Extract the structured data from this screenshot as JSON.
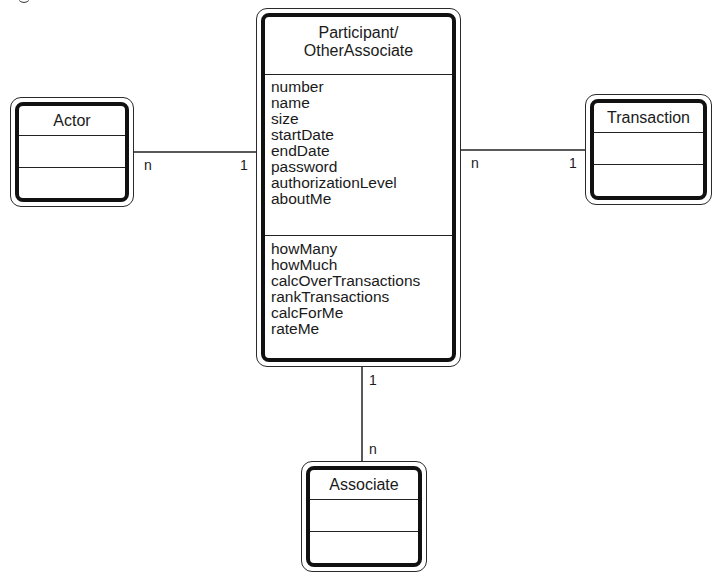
{
  "diagram": {
    "type": "UML class diagram",
    "classes": {
      "participant": {
        "name": "Participant/\nOtherAssociate",
        "name_line1": "Participant/",
        "name_line2": "OtherAssociate",
        "attributes": [
          "number",
          "name",
          "size",
          "startDate",
          "endDate",
          "password",
          "authorizationLevel",
          "aboutMe"
        ],
        "operations": [
          "howMany",
          "howMuch",
          "calcOverTransactions",
          "rankTransactions",
          "calcForMe",
          "rateMe"
        ]
      },
      "actor": {
        "name": "Actor",
        "attributes": [],
        "operations": []
      },
      "transaction": {
        "name": "Transaction",
        "attributes": [],
        "operations": []
      },
      "associate": {
        "name": "Associate",
        "attributes": [],
        "operations": []
      }
    },
    "associations": [
      {
        "from": "Actor",
        "to": "Participant/OtherAssociate",
        "from_mult": "n",
        "to_mult": "1"
      },
      {
        "from": "Participant/OtherAssociate",
        "to": "Transaction",
        "from_mult": "n",
        "to_mult": "1"
      },
      {
        "from": "Participant/OtherAssociate",
        "to": "Associate",
        "from_mult": "1",
        "to_mult": "n"
      }
    ],
    "multiplicity": {
      "actor_side": "n",
      "participant_left": "1",
      "participant_right": "n",
      "transaction_side": "1",
      "participant_bottom": "1",
      "associate_side": "n"
    }
  }
}
